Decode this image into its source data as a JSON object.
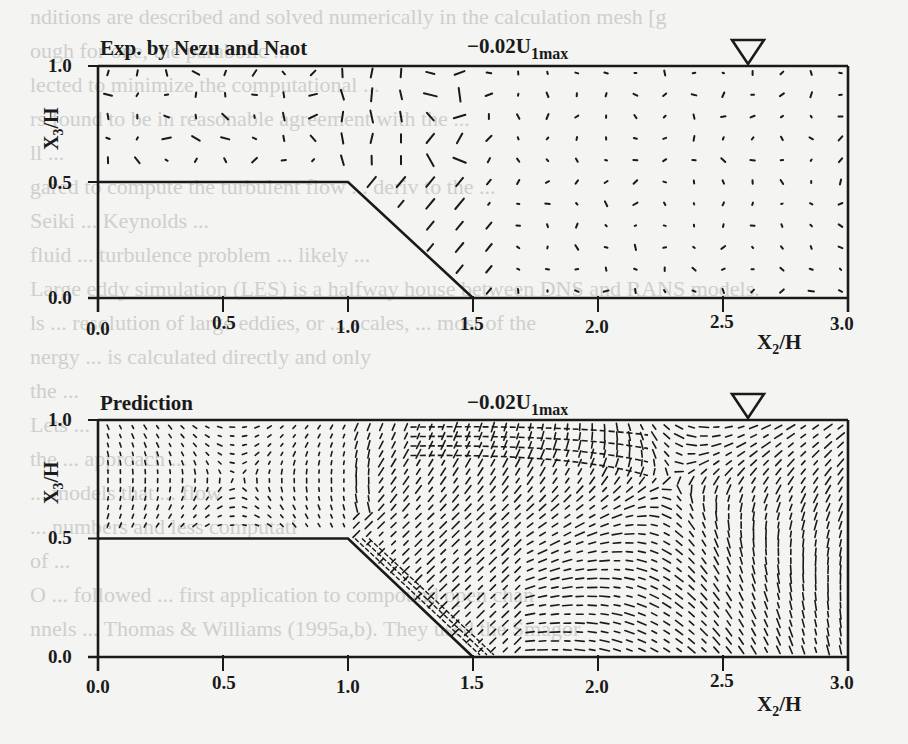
{
  "figure": {
    "panels": [
      {
        "id": "experiment",
        "title": "Exp. by Nezu and Naot",
        "scale_label_main": "−0.02U",
        "scale_label_sub": "1max",
        "free_surface_marker": "inverted-triangle",
        "y_axis": {
          "label_main": "X",
          "label_sub": "3",
          "label_rest": "/H",
          "ticks": [
            "1.0",
            "0.5",
            "0.0"
          ]
        },
        "x_axis": {
          "label_main": "X",
          "label_sub": "2",
          "label_rest": "/H",
          "ticks": [
            "0.0",
            "0.5",
            "1.0",
            "1.5",
            "2.0",
            "2.5",
            "3.0"
          ]
        }
      },
      {
        "id": "prediction",
        "title": "Prediction",
        "scale_label_main": "−0.02U",
        "scale_label_sub": "1max",
        "free_surface_marker": "inverted-triangle",
        "y_axis": {
          "label_main": "X",
          "label_sub": "3",
          "label_rest": "/H",
          "ticks": [
            "1.0",
            "0.5",
            "0.0"
          ]
        },
        "x_axis": {
          "label_main": "X",
          "label_sub": "2",
          "label_rest": "/H",
          "ticks": [
            "0.0",
            "0.5",
            "1.0",
            "1.5",
            "2.0",
            "2.5",
            "3.0"
          ]
        }
      }
    ],
    "geometry": {
      "floodplain_height": 0.5,
      "floodplain_edge_x": 1.0,
      "bank_toe_x": 1.5,
      "channel_right_x": 3.0,
      "surface_marker_x": 2.6
    }
  },
  "bleed_text": [
    "nditions are described and solved numerically in the calculation mesh [g",
    "ough for one, the parabolic ...",
    "lected to minimize the computational ...",
    "rs found to be in reasonable agreement with the ...",
    "ll ...",
    "gared to compute the turbulent flow ... deriv to the ...",
    "Seiki ... Keynolds ...",
    "fluid ... turbulence problem ... likely ...",
    "Large eddy simulation (LES) is a halfway house between DNS and RANS models.",
    "ls ... resolution of large eddies, or ... scales, ... most of the",
    "nergy ... is calculated directly and only",
    "the ...",
    "Lets ...",
    "the ... approach ...",
    "... models that ... flow",
    "... numbers and less computati",
    "of ...",
    "O ... followed ... first application to compound open chan",
    "nnels ... Thomas & Williams (1995a,b). They used the Smagor"
  ]
}
